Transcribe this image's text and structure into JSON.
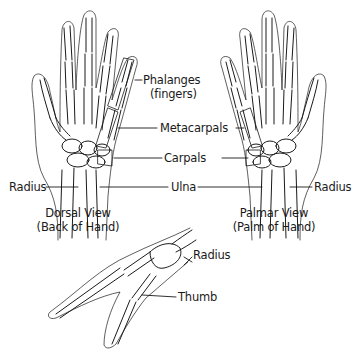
{
  "labels": {
    "phalanges": "Phalanges",
    "phalanges_sub": "(fingers)",
    "metacarpals": "Metacarpals",
    "carpals": "Carpals",
    "radius_left": "Radius",
    "ulna": "Ulna",
    "radius_right": "Radius",
    "radius_side": "Radius",
    "thumb": "Thumb"
  },
  "captions": {
    "dorsal_title": "Dorsal View",
    "dorsal_sub": "(Back of Hand)",
    "palmar_title": "Palmar View",
    "palmar_sub": "(Palm of Hand)"
  },
  "colors": {
    "line": "#1a1a1a",
    "background": "#ffffff"
  }
}
